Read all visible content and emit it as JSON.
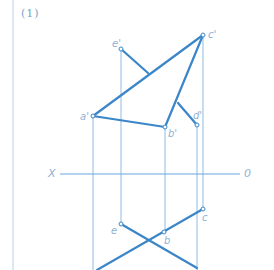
{
  "figure": {
    "title": "(1)",
    "axis": {
      "left_label": "X",
      "right_label": "0"
    },
    "colors": {
      "thick_line": "#3a86c8",
      "thin_line": "#8fbbe3",
      "label": "#8fb2d6",
      "border": "#b9d0ea"
    },
    "front_view_points": {
      "a_prime": {
        "label": "a'",
        "x": 93,
        "y": 116
      },
      "b_prime": {
        "label": "b'",
        "x": 165,
        "y": 127
      },
      "c_prime": {
        "label": "c'",
        "x": 203,
        "y": 35
      },
      "d_prime": {
        "label": "d'",
        "x": 197,
        "y": 125
      },
      "e_prime": {
        "label": "e'",
        "x": 121,
        "y": 49
      }
    },
    "top_view_points": {
      "b": {
        "label": "b",
        "x": 164,
        "y": 232
      },
      "c": {
        "label": "c",
        "x": 203,
        "y": 209
      },
      "e": {
        "label": "e",
        "x": 121,
        "y": 224
      }
    }
  }
}
